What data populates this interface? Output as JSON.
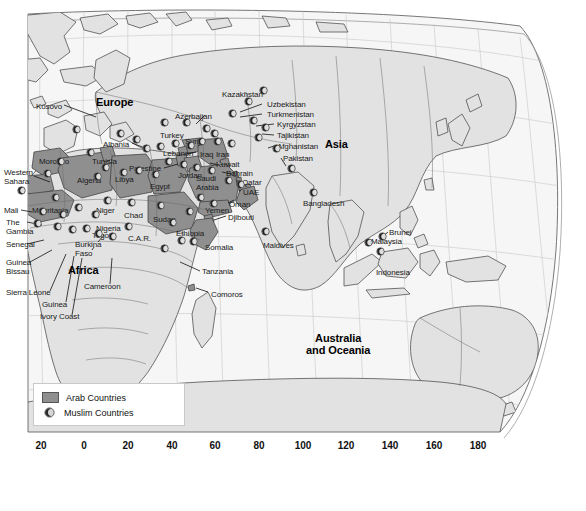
{
  "map": {
    "title": "World map of Arab and Muslim countries",
    "colors": {
      "arab_fill": "#8f8f8f",
      "land_fill": "#e2e2e2",
      "ocean_fill": "#f6f6f6",
      "border": "#4a4a4a",
      "graticule": "#cccccc",
      "text": "#1a1a1a"
    },
    "continents": [
      {
        "name": "Europe",
        "x": 100,
        "y": 100
      },
      {
        "name": "Africa",
        "x": 70,
        "y": 270
      },
      {
        "name": "Asia",
        "x": 327,
        "y": 144
      },
      {
        "name": "Australia and Oceania",
        "line1": "Australia",
        "line2": "and Oceania",
        "x": 310,
        "y": 336
      }
    ],
    "labels": [
      {
        "name": "Kosovo",
        "x": 36,
        "y": 102,
        "arab": false
      },
      {
        "name": "Albania",
        "x": 103,
        "y": 140,
        "arab": false
      },
      {
        "name": "Turkey",
        "x": 160,
        "y": 131,
        "arab": false
      },
      {
        "name": "Azerbaijan",
        "x": 175,
        "y": 112,
        "arab": false
      },
      {
        "name": "Syria",
        "x": 185,
        "y": 137,
        "arab": true
      },
      {
        "name": "Lebanon",
        "x": 163,
        "y": 149,
        "arab": true
      },
      {
        "name": "Palestine",
        "x": 129,
        "y": 164,
        "arab": true
      },
      {
        "name": "Jordan",
        "x": 178,
        "y": 171,
        "arab": true
      },
      {
        "name": "Iraq",
        "x": 200,
        "y": 150,
        "arab": true
      },
      {
        "name": "Iran",
        "x": 216,
        "y": 150,
        "arab": false
      },
      {
        "name": "Kuwait",
        "x": 216,
        "y": 160,
        "arab": true
      },
      {
        "name": "Bahrain",
        "x": 226,
        "y": 169,
        "arab": true
      },
      {
        "name": "Qatar",
        "x": 242,
        "y": 178,
        "arab": true
      },
      {
        "name": "UAE",
        "x": 243,
        "y": 188,
        "arab": true
      },
      {
        "name": "Oman",
        "x": 229,
        "y": 200,
        "arab": true
      },
      {
        "name": "Saudi Arabia",
        "line1": "Saudi",
        "line2": "Arabia",
        "x": 196,
        "y": 174,
        "arab": true
      },
      {
        "name": "Yemen",
        "x": 205,
        "y": 206,
        "arab": true
      },
      {
        "name": "Djibouti",
        "x": 228,
        "y": 213,
        "arab": true
      },
      {
        "name": "Egypt",
        "x": 150,
        "y": 182,
        "arab": true
      },
      {
        "name": "Libya",
        "x": 115,
        "y": 175,
        "arab": true
      },
      {
        "name": "Tunisia",
        "x": 92,
        "y": 157,
        "arab": true
      },
      {
        "name": "Algeria",
        "x": 77,
        "y": 176,
        "arab": true
      },
      {
        "name": "Morocco",
        "x": 39,
        "y": 157,
        "arab": true
      },
      {
        "name": "Western Sahara",
        "line1": "Western",
        "line2": "Sahara",
        "x": 4,
        "y": 168,
        "arab": true
      },
      {
        "name": "Mauritania",
        "x": 32,
        "y": 206,
        "arab": true
      },
      {
        "name": "Mali",
        "x": 4,
        "y": 206,
        "arab": false
      },
      {
        "name": "Niger",
        "x": 96,
        "y": 206,
        "arab": false
      },
      {
        "name": "Chad",
        "x": 124,
        "y": 211,
        "arab": false
      },
      {
        "name": "Sudan",
        "x": 153,
        "y": 215,
        "arab": true
      },
      {
        "name": "Nigeria",
        "x": 96,
        "y": 224,
        "arab": false
      },
      {
        "name": "C.A.R.",
        "x": 128,
        "y": 234,
        "arab": false
      },
      {
        "name": "Ethiopia",
        "x": 176,
        "y": 229,
        "arab": false
      },
      {
        "name": "Somalia",
        "x": 205,
        "y": 243,
        "arab": false
      },
      {
        "name": "Tanzania",
        "x": 202,
        "y": 267,
        "arab": false
      },
      {
        "name": "Comoros",
        "x": 211,
        "y": 290,
        "arab": false
      },
      {
        "name": "Cameroon",
        "x": 84,
        "y": 282,
        "arab": false
      },
      {
        "name": "The Gambia",
        "line1": "The",
        "line2": "Gambia",
        "x": 6,
        "y": 218,
        "arab": false
      },
      {
        "name": "Senegal",
        "x": 6,
        "y": 240,
        "arab": false
      },
      {
        "name": "Guinea Bissau",
        "line1": "Guinea",
        "line2": "Bissau",
        "x": 6,
        "y": 258,
        "arab": false
      },
      {
        "name": "Sierra Leone",
        "x": 6,
        "y": 288,
        "arab": false
      },
      {
        "name": "Guinea",
        "x": 42,
        "y": 300,
        "arab": false
      },
      {
        "name": "Ivory Coast",
        "x": 40,
        "y": 312,
        "arab": false
      },
      {
        "name": "Burkina Faso",
        "line1": "Burkina",
        "line2": "Faso",
        "x": 75,
        "y": 240,
        "arab": false
      },
      {
        "name": "Togo",
        "x": 92,
        "y": 231,
        "arab": false
      },
      {
        "name": "Kazakhstan",
        "x": 222,
        "y": 90,
        "arab": false
      },
      {
        "name": "Uzbekistan",
        "x": 267,
        "y": 100,
        "arab": false
      },
      {
        "name": "Turkmenistan",
        "x": 267,
        "y": 110,
        "arab": false
      },
      {
        "name": "Kyrgyzstan",
        "x": 277,
        "y": 120,
        "arab": false
      },
      {
        "name": "Tajikistan",
        "x": 277,
        "y": 131,
        "arab": false
      },
      {
        "name": "Afghanistan",
        "x": 277,
        "y": 142,
        "arab": false
      },
      {
        "name": "Pakistan",
        "x": 283,
        "y": 154,
        "arab": false
      },
      {
        "name": "Bangladesh",
        "x": 303,
        "y": 199,
        "arab": false
      },
      {
        "name": "Maldives",
        "x": 263,
        "y": 241,
        "arab": false
      },
      {
        "name": "Brunei",
        "x": 389,
        "y": 228,
        "arab": false
      },
      {
        "name": "Malaysia",
        "x": 371,
        "y": 237,
        "arab": false
      },
      {
        "name": "Indonesia",
        "x": 376,
        "y": 268,
        "arab": false
      }
    ],
    "muslim_marker_symbol": "☾",
    "muslim_markers": [
      {
        "x": 76,
        "y": 129
      },
      {
        "x": 120,
        "y": 133
      },
      {
        "x": 136,
        "y": 139
      },
      {
        "x": 164,
        "y": 122
      },
      {
        "x": 186,
        "y": 122
      },
      {
        "x": 206,
        "y": 128
      },
      {
        "x": 214,
        "y": 133
      },
      {
        "x": 146,
        "y": 148
      },
      {
        "x": 160,
        "y": 146
      },
      {
        "x": 175,
        "y": 143
      },
      {
        "x": 190,
        "y": 145
      },
      {
        "x": 201,
        "y": 141
      },
      {
        "x": 217,
        "y": 141
      },
      {
        "x": 231,
        "y": 143
      },
      {
        "x": 90,
        "y": 152
      },
      {
        "x": 60,
        "y": 161
      },
      {
        "x": 105,
        "y": 167
      },
      {
        "x": 138,
        "y": 170
      },
      {
        "x": 168,
        "y": 161
      },
      {
        "x": 183,
        "y": 164
      },
      {
        "x": 196,
        "y": 167
      },
      {
        "x": 211,
        "y": 170
      },
      {
        "x": 228,
        "y": 180
      },
      {
        "x": 240,
        "y": 184
      },
      {
        "x": 47,
        "y": 173
      },
      {
        "x": 97,
        "y": 176
      },
      {
        "x": 123,
        "y": 172
      },
      {
        "x": 155,
        "y": 174
      },
      {
        "x": 21,
        "y": 190
      },
      {
        "x": 55,
        "y": 197
      },
      {
        "x": 200,
        "y": 197
      },
      {
        "x": 213,
        "y": 203
      },
      {
        "x": 107,
        "y": 200
      },
      {
        "x": 131,
        "y": 202
      },
      {
        "x": 160,
        "y": 205
      },
      {
        "x": 189,
        "y": 211
      },
      {
        "x": 42,
        "y": 211
      },
      {
        "x": 62,
        "y": 214
      },
      {
        "x": 78,
        "y": 207
      },
      {
        "x": 95,
        "y": 214
      },
      {
        "x": 37,
        "y": 223
      },
      {
        "x": 57,
        "y": 226
      },
      {
        "x": 72,
        "y": 229
      },
      {
        "x": 86,
        "y": 228
      },
      {
        "x": 98,
        "y": 233
      },
      {
        "x": 112,
        "y": 236
      },
      {
        "x": 128,
        "y": 226
      },
      {
        "x": 172,
        "y": 222
      },
      {
        "x": 181,
        "y": 240
      },
      {
        "x": 193,
        "y": 241
      },
      {
        "x": 164,
        "y": 248
      },
      {
        "x": 263,
        "y": 90
      },
      {
        "x": 248,
        "y": 101
      },
      {
        "x": 232,
        "y": 113
      },
      {
        "x": 253,
        "y": 120
      },
      {
        "x": 265,
        "y": 127
      },
      {
        "x": 258,
        "y": 137
      },
      {
        "x": 276,
        "y": 148
      },
      {
        "x": 291,
        "y": 168
      },
      {
        "x": 313,
        "y": 192
      },
      {
        "x": 265,
        "y": 231
      },
      {
        "x": 382,
        "y": 236
      },
      {
        "x": 380,
        "y": 251
      },
      {
        "x": 368,
        "y": 242
      }
    ],
    "legend": {
      "items": [
        {
          "type": "swatch",
          "label": "Arab Countries",
          "color": "#8f8f8f"
        },
        {
          "type": "crescent",
          "label": "Muslim Countries",
          "symbol": "☾"
        }
      ]
    },
    "axis": {
      "orientation": "horizontal",
      "label": "longitude",
      "ticks": [
        {
          "value": "20",
          "x": 41
        },
        {
          "value": "0",
          "x": 84
        },
        {
          "value": "20",
          "x": 128
        },
        {
          "value": "40",
          "x": 172
        },
        {
          "value": "60",
          "x": 215
        },
        {
          "value": "80",
          "x": 259
        },
        {
          "value": "100",
          "x": 303
        },
        {
          "value": "120",
          "x": 346
        },
        {
          "value": "140",
          "x": 390
        },
        {
          "value": "160",
          "x": 434
        },
        {
          "value": "180",
          "x": 478
        }
      ]
    }
  }
}
